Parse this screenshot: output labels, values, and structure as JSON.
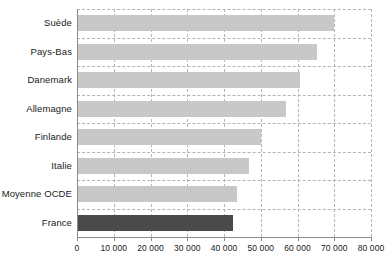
{
  "chart_data": {
    "type": "bar",
    "orientation": "horizontal",
    "title": "",
    "xlabel": "",
    "ylabel": "",
    "categories": [
      "Suède",
      "Pays-Bas",
      "Danemark",
      "Allemagne",
      "Finlande",
      "Italie",
      "Moyenne OCDE",
      "France"
    ],
    "values": [
      70000,
      65300,
      60800,
      57000,
      50000,
      46700,
      43500,
      42400
    ],
    "xlim": [
      0,
      80000
    ],
    "xticks": [
      0,
      10000,
      20000,
      30000,
      40000,
      50000,
      60000,
      70000,
      80000
    ],
    "xtick_labels": [
      "0",
      "10 000",
      "20 000",
      "30 000",
      "40 000",
      "50 000",
      "60 000",
      "70 000",
      "80 000"
    ],
    "grid": true,
    "grid_style": "dashed vertical and horizontal",
    "legend": null,
    "bar_colors": [
      "#c8c8c8",
      "#c8c8c8",
      "#c8c8c8",
      "#c8c8c8",
      "#c8c8c8",
      "#c8c8c8",
      "#c8c8c8",
      "#4a4a4a"
    ],
    "highlight_category": "France",
    "colors": {
      "bar_default": "#c8c8c8",
      "bar_highlight": "#4a4a4a",
      "grid": "#b5b5b5",
      "axis": "#8a8a8a",
      "text": "#1a1a1a",
      "background": "#ffffff"
    }
  }
}
